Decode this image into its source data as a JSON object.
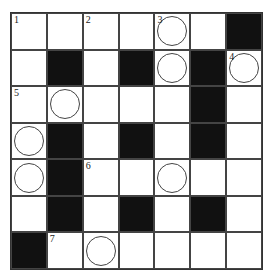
{
  "puzzle": {
    "type": "crossword",
    "rows": 7,
    "cols": 7,
    "colors": {
      "black": "#111111",
      "white": "#ffffff",
      "line": "#444444"
    },
    "grid": [
      [
        {
          "n": "1"
        },
        {},
        {
          "n": "2"
        },
        {},
        {
          "n": "3",
          "c": true
        },
        {},
        {
          "b": true
        }
      ],
      [
        {},
        {
          "b": true
        },
        {},
        {
          "b": true
        },
        {
          "c": true
        },
        {
          "b": true
        },
        {
          "n": "4",
          "c": true
        }
      ],
      [
        {
          "n": "5"
        },
        {
          "c": true
        },
        {},
        {},
        {},
        {
          "b": true
        },
        {}
      ],
      [
        {
          "c": true
        },
        {
          "b": true
        },
        {},
        {
          "b": true
        },
        {},
        {
          "b": true
        },
        {}
      ],
      [
        {
          "c": true
        },
        {
          "b": true
        },
        {
          "n": "6"
        },
        {},
        {
          "c": true
        },
        {},
        {}
      ],
      [
        {},
        {
          "b": true
        },
        {},
        {
          "b": true
        },
        {},
        {
          "b": true
        },
        {}
      ],
      [
        {
          "b": true
        },
        {
          "n": "7"
        },
        {
          "c": true
        },
        {},
        {},
        {},
        {}
      ]
    ]
  }
}
